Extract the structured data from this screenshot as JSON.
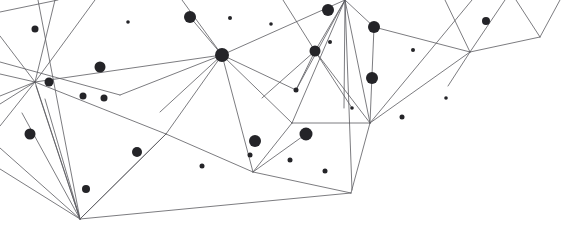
{
  "graphic": {
    "title": "Abstract Network Constellation",
    "kind": "low-poly-network",
    "width": 582,
    "height": 238,
    "background_color": "#ffffff",
    "edge_color": "#5a5a5f",
    "edge_width": 0.8,
    "node_color": "#242428",
    "node_count": 30,
    "edge_count": 58
  },
  "chart_data": {
    "type": "scatter",
    "title": "Abstract Network Constellation",
    "subtitle": "",
    "xlabel": "",
    "ylabel": "",
    "xlim": [
      0,
      582
    ],
    "ylim": [
      0,
      238
    ],
    "grid": false,
    "legend": "none",
    "annotations": [],
    "nodes": [
      {
        "id": "n1",
        "x": 35,
        "y": 29,
        "r": 3.5
      },
      {
        "id": "n2",
        "x": 100,
        "y": 67,
        "r": 5.5
      },
      {
        "id": "n3",
        "x": 49,
        "y": 82,
        "r": 4.5
      },
      {
        "id": "n4",
        "x": 83,
        "y": 96,
        "r": 3.5
      },
      {
        "id": "n5",
        "x": 104,
        "y": 98,
        "r": 3.5
      },
      {
        "id": "n6",
        "x": 30,
        "y": 134,
        "r": 5.5
      },
      {
        "id": "n7",
        "x": 137,
        "y": 152,
        "r": 5.0
      },
      {
        "id": "n8",
        "x": 86,
        "y": 189,
        "r": 4.0
      },
      {
        "id": "n9",
        "x": 190,
        "y": 17,
        "r": 6.0
      },
      {
        "id": "n10",
        "x": 230,
        "y": 18,
        "r": 2.0
      },
      {
        "id": "n11",
        "x": 222,
        "y": 55,
        "r": 7.0
      },
      {
        "id": "n12",
        "x": 202,
        "y": 166,
        "r": 2.5
      },
      {
        "id": "n13",
        "x": 250,
        "y": 155,
        "r": 2.5
      },
      {
        "id": "n14",
        "x": 255,
        "y": 141,
        "r": 6.0
      },
      {
        "id": "n15",
        "x": 290,
        "y": 160,
        "r": 2.5
      },
      {
        "id": "n16",
        "x": 306,
        "y": 134,
        "r": 6.5
      },
      {
        "id": "n17",
        "x": 325,
        "y": 171,
        "r": 2.5
      },
      {
        "id": "n18",
        "x": 296,
        "y": 90,
        "r": 2.5
      },
      {
        "id": "n19",
        "x": 315,
        "y": 51,
        "r": 5.5
      },
      {
        "id": "n20",
        "x": 330,
        "y": 42,
        "r": 2.0
      },
      {
        "id": "n21",
        "x": 328,
        "y": 10,
        "r": 6.0
      },
      {
        "id": "n22",
        "x": 374,
        "y": 27,
        "r": 6.0
      },
      {
        "id": "n23",
        "x": 372,
        "y": 78,
        "r": 6.0
      },
      {
        "id": "n24",
        "x": 413,
        "y": 50,
        "r": 2.0
      },
      {
        "id": "n25",
        "x": 402,
        "y": 117,
        "r": 2.5
      },
      {
        "id": "n26",
        "x": 486,
        "y": 21,
        "r": 4.0
      },
      {
        "id": "n27",
        "x": 128,
        "y": 22,
        "r": 1.8
      },
      {
        "id": "n28",
        "x": 352,
        "y": 108,
        "r": 1.8
      },
      {
        "id": "n29",
        "x": 271,
        "y": 24,
        "r": 1.8
      },
      {
        "id": "n30",
        "x": 446,
        "y": 98,
        "r": 1.8
      }
    ],
    "vertices": [
      {
        "id": "h_left",
        "x": 35,
        "y": 82
      },
      {
        "id": "h_bottom",
        "x": 80,
        "y": 219
      },
      {
        "id": "h_hub",
        "x": 222,
        "y": 55
      },
      {
        "id": "h_topmid",
        "x": 345,
        "y": 0
      },
      {
        "id": "h_right",
        "x": 370,
        "y": 123
      },
      {
        "id": "h_midlow",
        "x": 253,
        "y": 172
      },
      {
        "id": "h_brvert",
        "x": 351,
        "y": 193
      },
      {
        "id": "h_vnotch",
        "x": 540,
        "y": 37
      },
      {
        "id": "h_junc",
        "x": 470,
        "y": 52
      },
      {
        "id": "h_peak",
        "x": 166,
        "y": 134
      },
      {
        "id": "h_elbow",
        "x": 292,
        "y": 123
      }
    ],
    "edges": [
      [
        0,
        74,
        35,
        82
      ],
      [
        35,
        82,
        0,
        96
      ],
      [
        0,
        104,
        35,
        82
      ],
      [
        35,
        82,
        0,
        126
      ],
      [
        35,
        82,
        80,
        219
      ],
      [
        35,
        82,
        95,
        0
      ],
      [
        35,
        82,
        55,
        0
      ],
      [
        35,
        82,
        222,
        55
      ],
      [
        35,
        82,
        166,
        134
      ],
      [
        0,
        36,
        35,
        82
      ],
      [
        0,
        12,
        58,
        0
      ],
      [
        80,
        219,
        0,
        148
      ],
      [
        80,
        219,
        0,
        169
      ],
      [
        80,
        219,
        22,
        113
      ],
      [
        80,
        219,
        45,
        99
      ],
      [
        80,
        219,
        36,
        86
      ],
      [
        80,
        219,
        166,
        134
      ],
      [
        80,
        219,
        351,
        193
      ],
      [
        38,
        0,
        80,
        219
      ],
      [
        166,
        134,
        222,
        55
      ],
      [
        166,
        134,
        253,
        172
      ],
      [
        166,
        134,
        80,
        219
      ],
      [
        222,
        55,
        190,
        17
      ],
      [
        222,
        55,
        345,
        0
      ],
      [
        222,
        55,
        182,
        0
      ],
      [
        222,
        55,
        253,
        172
      ],
      [
        222,
        55,
        296,
        90
      ],
      [
        222,
        55,
        292,
        123
      ],
      [
        222,
        55,
        160,
        112
      ],
      [
        345,
        0,
        315,
        51
      ],
      [
        345,
        0,
        296,
        90
      ],
      [
        345,
        0,
        292,
        123
      ],
      [
        345,
        0,
        374,
        27
      ],
      [
        345,
        0,
        370,
        123
      ],
      [
        345,
        0,
        344,
        108
      ],
      [
        345,
        0,
        352,
        190
      ],
      [
        315,
        51,
        296,
        90
      ],
      [
        315,
        51,
        283,
        0
      ],
      [
        315,
        51,
        352,
        108
      ],
      [
        315,
        51,
        370,
        123
      ],
      [
        315,
        51,
        262,
        98
      ],
      [
        292,
        123,
        370,
        123
      ],
      [
        292,
        123,
        253,
        172
      ],
      [
        253,
        172,
        351,
        193
      ],
      [
        253,
        172,
        306,
        134
      ],
      [
        370,
        123,
        351,
        193
      ],
      [
        370,
        123,
        374,
        27
      ],
      [
        370,
        123,
        470,
        52
      ],
      [
        370,
        123,
        472,
        0
      ],
      [
        374,
        27,
        470,
        52
      ],
      [
        470,
        52,
        540,
        37
      ],
      [
        470,
        52,
        445,
        0
      ],
      [
        470,
        52,
        505,
        0
      ],
      [
        470,
        52,
        448,
        86
      ],
      [
        540,
        37,
        516,
        0
      ],
      [
        540,
        37,
        560,
        0
      ],
      [
        0,
        62,
        120,
        95
      ],
      [
        120,
        95,
        222,
        55
      ]
    ]
  }
}
